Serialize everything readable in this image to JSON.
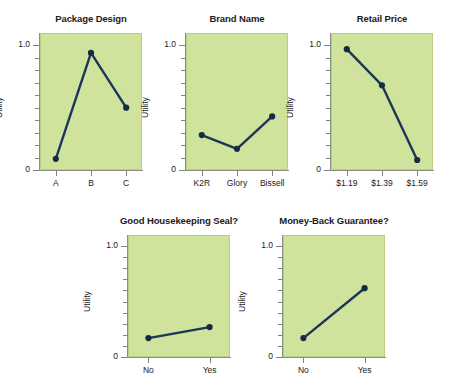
{
  "figure": {
    "background_color": "#ffffff",
    "plot_fill_color": "#cfe39c",
    "line_color": "#1d3557",
    "marker_color": "#152a45",
    "axis_color": "#8a8f86"
  },
  "chart_data": [
    {
      "type": "line",
      "title": "Package Design",
      "xlabel": "",
      "ylabel": "Utility",
      "categories": [
        "A",
        "B",
        "C"
      ],
      "values": [
        0.09,
        0.94,
        0.5
      ],
      "ylim": [
        0,
        1.1
      ],
      "ytick_values": [
        0,
        1.0
      ],
      "ytick_labels": [
        "0",
        "1.0"
      ],
      "grid": false,
      "legend": "none"
    },
    {
      "type": "line",
      "title": "Brand Name",
      "xlabel": "",
      "ylabel": "Utility",
      "categories": [
        "K2R",
        "Glory",
        "Bissell"
      ],
      "values": [
        0.28,
        0.17,
        0.43
      ],
      "ylim": [
        0,
        1.1
      ],
      "ytick_values": [
        0,
        1.0
      ],
      "ytick_labels": [
        "0",
        "1.0"
      ],
      "grid": false,
      "legend": "none"
    },
    {
      "type": "line",
      "title": "Retail Price",
      "xlabel": "",
      "ylabel": "Utility",
      "categories": [
        "$1.19",
        "$1.39",
        "$1.59"
      ],
      "values": [
        0.97,
        0.68,
        0.08
      ],
      "ylim": [
        0,
        1.1
      ],
      "ytick_values": [
        0,
        1.0
      ],
      "ytick_labels": [
        "0",
        "1.0"
      ],
      "grid": false,
      "legend": "none"
    },
    {
      "type": "line",
      "title": "Good Housekeeping Seal?",
      "xlabel": "",
      "ylabel": "Utility",
      "categories": [
        "No",
        "Yes"
      ],
      "values": [
        0.17,
        0.27
      ],
      "ylim": [
        0,
        1.1
      ],
      "ytick_values": [
        0,
        1.0
      ],
      "ytick_labels": [
        "0",
        "1.0"
      ],
      "grid": false,
      "legend": "none"
    },
    {
      "type": "line",
      "title": "Money-Back Guarantee?",
      "xlabel": "",
      "ylabel": "Utility",
      "categories": [
        "No",
        "Yes"
      ],
      "values": [
        0.17,
        0.62
      ],
      "ylim": [
        0,
        1.1
      ],
      "ytick_values": [
        0,
        1.0
      ],
      "ytick_labels": [
        "0",
        "1.0"
      ],
      "grid": false,
      "legend": "none"
    }
  ]
}
